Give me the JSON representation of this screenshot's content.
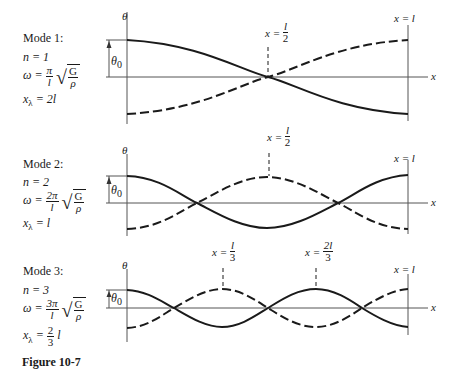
{
  "figure": {
    "caption": "Figure 10-7",
    "axis_labels": {
      "theta": "θ",
      "x": "x",
      "theta0": "θ",
      "theta0_sub": "0",
      "right_end": "x = l"
    },
    "modes": [
      {
        "title": "Mode 1:",
        "n": "n = 1",
        "omega_prefix": "ω =",
        "omega_num": "π",
        "omega_den": "l",
        "sqrt_num": "G",
        "sqrt_den": "ρ",
        "lambda_prefix": "x",
        "lambda_sub": "λ",
        "lambda_value": "= 2l",
        "annotations": [
          {
            "prefix": "x =",
            "num": "l",
            "den": "2"
          }
        ]
      },
      {
        "title": "Mode 2:",
        "n": "n = 2",
        "omega_prefix": "ω =",
        "omega_num": "2π",
        "omega_den": "l",
        "sqrt_num": "G",
        "sqrt_den": "ρ",
        "lambda_prefix": "x",
        "lambda_sub": "λ",
        "lambda_value": "= l",
        "annotations": [
          {
            "prefix": "x =",
            "num": "l",
            "den": "2"
          }
        ]
      },
      {
        "title": "Mode 3:",
        "n": "n = 3",
        "omega_prefix": "ω =",
        "omega_num": "3π",
        "omega_den": "l",
        "sqrt_num": "G",
        "sqrt_den": "ρ",
        "lambda_prefix": "x",
        "lambda_sub": "λ",
        "lambda_value_prefix": "=",
        "lambda_frac_num": "2",
        "lambda_frac_den": "3",
        "lambda_value_suffix": "l",
        "annotations": [
          {
            "prefix": "x =",
            "num": "l",
            "den": "3"
          },
          {
            "prefix": "x =",
            "num": "2l",
            "den": "3"
          }
        ]
      }
    ]
  },
  "colors": {
    "ink": "#1a1a1a",
    "axis": "#555555",
    "background": "#ffffff"
  }
}
